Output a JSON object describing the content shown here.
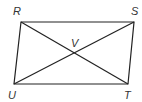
{
  "diagram": {
    "type": "parallelogram with diagonals",
    "vertices": [
      {
        "label": "R",
        "x": 21,
        "y": 22,
        "lx": 13,
        "ly": 15
      },
      {
        "label": "S",
        "x": 134,
        "y": 22,
        "lx": 131,
        "ly": 15
      },
      {
        "label": "T",
        "x": 128,
        "y": 84,
        "lx": 124,
        "ly": 99
      },
      {
        "label": "U",
        "x": 14,
        "y": 84,
        "lx": 8,
        "ly": 99
      }
    ],
    "intersection": {
      "label": "V",
      "lx": 71,
      "ly": 48
    },
    "stroke_color": "#222222"
  }
}
